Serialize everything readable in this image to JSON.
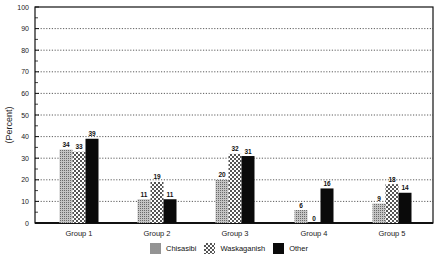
{
  "chart_data": {
    "type": "bar",
    "title": "",
    "xlabel": "",
    "ylabel": "(Percent)",
    "ylim": [
      0,
      100
    ],
    "yticks": [
      0,
      10,
      20,
      30,
      40,
      50,
      60,
      70,
      80,
      90,
      100
    ],
    "grid": "horizontal dotted",
    "legend_position": "bottom",
    "categories": [
      "Group 1",
      "Group 2",
      "Group 3",
      "Group 4",
      "Group 5"
    ],
    "series": [
      {
        "name": "Chisasibi",
        "pattern": "fine-dots",
        "values": [
          34,
          11,
          20,
          6,
          9
        ]
      },
      {
        "name": "Waskaganish",
        "pattern": "checker",
        "values": [
          33,
          19,
          32,
          0,
          18
        ]
      },
      {
        "name": "Other",
        "pattern": "solid-black",
        "values": [
          39,
          11,
          31,
          16,
          14
        ]
      }
    ]
  },
  "legend": {
    "items": [
      {
        "label": "Chisasibi"
      },
      {
        "label": "Waskaganish"
      },
      {
        "label": "Other"
      }
    ]
  }
}
